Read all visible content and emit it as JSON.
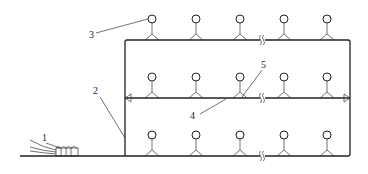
{
  "diagram": {
    "type": "sprinkler irrigation pipe network schematic",
    "labels": [
      {
        "id": "1",
        "text": "1",
        "x": 42,
        "y": 141,
        "target": "pump / water source unit"
      },
      {
        "id": "2",
        "text": "2",
        "x": 95,
        "y": 93,
        "target": "main pipe"
      },
      {
        "id": "3",
        "text": "3",
        "x": 91,
        "y": 37,
        "target": "sprinkler head"
      },
      {
        "id": "4",
        "text": "4",
        "x": 190,
        "y": 118,
        "target": "lateral pipe"
      },
      {
        "id": "5",
        "text": "5",
        "x": 261,
        "y": 67,
        "target": "riser"
      }
    ],
    "rows": [
      {
        "name": "top-lateral",
        "y": 40
      },
      {
        "name": "middle-lateral",
        "y": 98
      },
      {
        "name": "bottom-lateral",
        "y": 156
      }
    ],
    "sprinkler_columns_x": [
      152,
      196,
      240,
      284,
      327
    ],
    "break_mark_x": 262,
    "colors": {
      "line": "#222222",
      "background": "#ffffff"
    }
  }
}
